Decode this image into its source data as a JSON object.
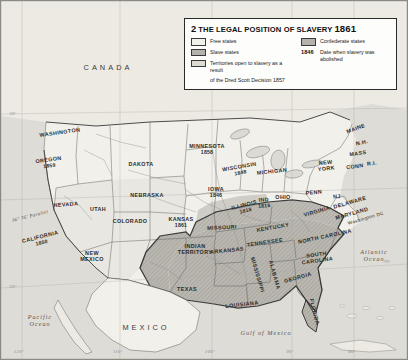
{
  "legend": {
    "number": "2",
    "title": "THE LEGAL POSITION OF SLAVERY",
    "year": "1861",
    "items": [
      {
        "key": "free",
        "label": "Free states",
        "swatch": "#f2f0ea"
      },
      {
        "key": "slave",
        "label": "Slave states",
        "swatch": "#b4b2ab"
      },
      {
        "key": "terr",
        "label": "Territories open to slavery as a result",
        "label2": "of the Dred Scott Decision 1857",
        "swatch": "#dcdad3"
      },
      {
        "key": "conf",
        "label": "Confederate states",
        "swatch": "#b4b2ab"
      }
    ],
    "date_key": {
      "sample": "1846",
      "label": "Date when slavery was abolished"
    }
  },
  "countries": [
    {
      "name": "CANADA",
      "x": 108,
      "y": 68
    },
    {
      "name": "MEXICO",
      "x": 146,
      "y": 328
    }
  ],
  "oceans": [
    {
      "name": "Pacific\nOcean",
      "x": 40,
      "y": 320
    },
    {
      "name": "Atlantic\nOcean",
      "x": 374,
      "y": 255
    },
    {
      "name": "Gulf of Mexico",
      "x": 266,
      "y": 333
    }
  ],
  "annotations": [
    {
      "name": "36° 36' Parallel",
      "x": 30,
      "y": 216,
      "rot": -14
    }
  ],
  "graticule": [
    {
      "label": "120°",
      "x": 19,
      "y": 352
    },
    {
      "label": "110°",
      "x": 118,
      "y": 352
    },
    {
      "label": "100°",
      "x": 210,
      "y": 352
    },
    {
      "label": "90°",
      "x": 290,
      "y": 352
    },
    {
      "label": "80°",
      "x": 352,
      "y": 352
    },
    {
      "label": "70°",
      "x": 387,
      "y": 262
    },
    {
      "label": "30°",
      "x": 13,
      "y": 287
    },
    {
      "label": "30°",
      "x": 13,
      "y": 114
    }
  ],
  "states": [
    {
      "name": "WASHINGTON",
      "x": 60,
      "y": 133,
      "rot": -8,
      "cls": "free"
    },
    {
      "name": "OREGON",
      "year": "1859",
      "x": 49,
      "y": 163,
      "rot": -8,
      "cls": "free"
    },
    {
      "name": "NEVADA",
      "x": 66,
      "y": 205,
      "rot": -4,
      "cls": "terr"
    },
    {
      "name": "CALIFORNIA",
      "year": "1850",
      "x": 41,
      "y": 240,
      "rot": -14,
      "cls": "free"
    },
    {
      "name": "UTAH",
      "x": 98,
      "y": 210,
      "rot": 0,
      "cls": "terr"
    },
    {
      "name": "COLORADO",
      "x": 130,
      "y": 222,
      "rot": 0,
      "cls": "terr"
    },
    {
      "name": "DAKOTA",
      "x": 141,
      "y": 165,
      "rot": 0,
      "cls": "terr"
    },
    {
      "name": "NEBRASKA",
      "x": 147,
      "y": 196,
      "rot": 0,
      "cls": "terr"
    },
    {
      "name": "NEW\nMEXICO",
      "x": 92,
      "y": 257,
      "rot": 0,
      "cls": "terr"
    },
    {
      "name": "KANSAS",
      "year": "1861",
      "x": 181,
      "y": 223,
      "rot": 0,
      "cls": "free"
    },
    {
      "name": "INDIAN\nTERRITORY",
      "x": 195,
      "y": 250,
      "rot": 0,
      "cls": "terr"
    },
    {
      "name": "TEXAS",
      "x": 187,
      "y": 290,
      "rot": 0,
      "cls": "conf"
    },
    {
      "name": "MINNESOTA",
      "year": "1858",
      "x": 207,
      "y": 150,
      "rot": 0,
      "cls": "free"
    },
    {
      "name": "IOWA",
      "year": "1846",
      "x": 216,
      "y": 193,
      "rot": 0,
      "cls": "free"
    },
    {
      "name": "WISCONSIN",
      "year": "1848",
      "x": 240,
      "y": 170,
      "rot": -10,
      "cls": "free"
    },
    {
      "name": "MICHIGAN",
      "x": 272,
      "y": 172,
      "rot": -6,
      "cls": "free"
    },
    {
      "name": "ILLINOIS",
      "year": "1818",
      "x": 245,
      "y": 208,
      "rot": -14,
      "cls": "free"
    },
    {
      "name": "IND",
      "year": "1816",
      "x": 264,
      "y": 203,
      "rot": -4,
      "cls": "free"
    },
    {
      "name": "OHIO",
      "x": 283,
      "y": 198,
      "rot": 0,
      "cls": "free"
    },
    {
      "name": "MISSOURI",
      "x": 222,
      "y": 228,
      "rot": -3,
      "cls": "slave"
    },
    {
      "name": "ARKANSAS",
      "x": 227,
      "y": 251,
      "rot": -6,
      "cls": "conf"
    },
    {
      "name": "LOUISIANA",
      "x": 242,
      "y": 305,
      "rot": -6,
      "cls": "conf"
    },
    {
      "name": "MISSISSIPPI",
      "x": 257,
      "y": 275,
      "rot": 74,
      "cls": "conf"
    },
    {
      "name": "ALABAMA",
      "x": 274,
      "y": 275,
      "rot": 74,
      "cls": "conf"
    },
    {
      "name": "TENNESSEE",
      "x": 265,
      "y": 243,
      "rot": -8,
      "cls": "conf"
    },
    {
      "name": "KENTUCKY",
      "x": 273,
      "y": 228,
      "rot": -10,
      "cls": "slave"
    },
    {
      "name": "GEORGIA",
      "x": 298,
      "y": 278,
      "rot": -16,
      "cls": "conf"
    },
    {
      "name": "FLORIDA",
      "x": 314,
      "y": 312,
      "rot": 76,
      "cls": "conf"
    },
    {
      "name": "SOUTH\nCAROLINA",
      "x": 317,
      "y": 258,
      "rot": -8,
      "cls": "conf"
    },
    {
      "name": "NORTH CAROLINA",
      "x": 325,
      "y": 237,
      "rot": -12,
      "cls": "conf"
    },
    {
      "name": "VIRGINIA",
      "x": 317,
      "y": 212,
      "rot": -16,
      "cls": "conf"
    },
    {
      "name": "PENN",
      "x": 314,
      "y": 193,
      "rot": -6,
      "cls": "free"
    },
    {
      "name": "NEW\nYORK",
      "x": 326,
      "y": 166,
      "rot": -6,
      "cls": "free"
    },
    {
      "name": "MAINE",
      "x": 356,
      "y": 129,
      "rot": -20,
      "cls": "free"
    },
    {
      "name": "N.H.",
      "x": 362,
      "y": 143,
      "rot": -12,
      "cls": "free"
    },
    {
      "name": "MASS",
      "x": 358,
      "y": 154,
      "rot": -8,
      "cls": "free"
    },
    {
      "name": "CONN",
      "x": 355,
      "y": 167,
      "rot": -8,
      "cls": "free"
    },
    {
      "name": "R.I.",
      "x": 372,
      "y": 164,
      "rot": -8,
      "cls": "free"
    },
    {
      "name": "NJ",
      "x": 337,
      "y": 197,
      "rot": -4,
      "cls": "free"
    },
    {
      "name": "DELAWARE",
      "x": 350,
      "y": 203,
      "rot": -16,
      "cls": "slave"
    },
    {
      "name": "MARYLAND",
      "x": 352,
      "y": 214,
      "rot": -16,
      "cls": "slave"
    },
    {
      "name": "Washington DC",
      "x": 366,
      "y": 219,
      "rot": -16,
      "cls": "capital"
    }
  ]
}
